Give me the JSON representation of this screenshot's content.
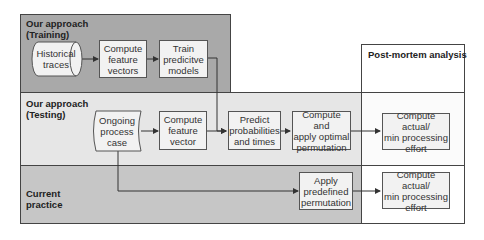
{
  "regions": {
    "training": {
      "title": "Our approach\n(Training)",
      "color": "#a9a9a9"
    },
    "testing": {
      "title": "Our approach\n(Testing)",
      "color": "#e6e6e6"
    },
    "current": {
      "title": "Current\npractice",
      "color": "#c6c6c6"
    },
    "postmortem": {
      "title": "Post-mortem analysis",
      "color": "#ffffff"
    }
  },
  "nodes": {
    "historical_traces": "Historical\ntraces",
    "compute_feature_vectors": "Compute\nfeature\nvectors",
    "train_models": "Train\npredicitve\nmodels",
    "ongoing_case": "Ongoing\nprocess\ncase",
    "compute_feature_vector": "Compute\nfeature\nvector",
    "predict": "Predict\nprobabilities\nand times",
    "apply_optimal": "Compute and\napply optimal\npermutation",
    "effort_testing": "Compute actual/\nmin processing\neffort",
    "apply_predefined": "Apply\npredefined\npermutation",
    "effort_current": "Compute actual/\nmin processing\neffort"
  }
}
